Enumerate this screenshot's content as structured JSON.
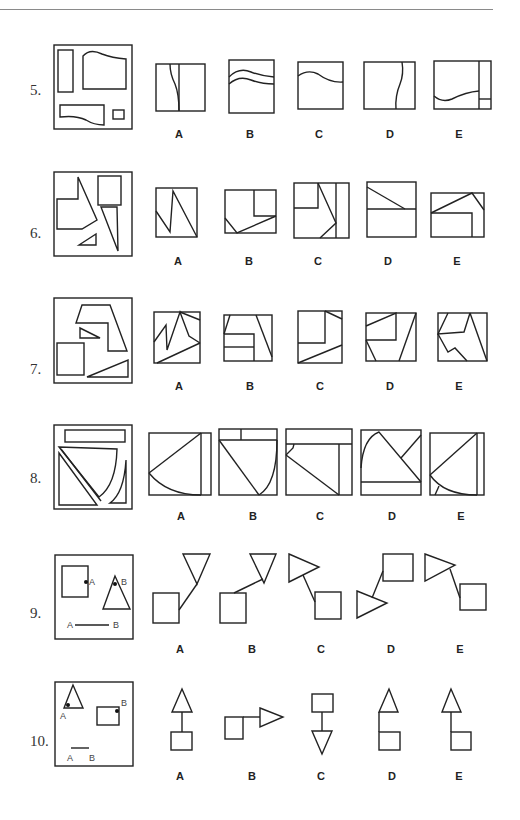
{
  "page": {
    "background": "#ffffff",
    "ink_color": "#222222"
  },
  "questions": [
    {
      "number": "5.",
      "prompt_figure": "square frame containing a tall rectangle, a wide shape with wavy top edge, a flat shape with wavy bottom edge, and a small square",
      "options": [
        {
          "label": "A",
          "description": "square split by a vertical line and a wavy vertical curve"
        },
        {
          "label": "B",
          "description": "square crossed by two parallel wavy horizontal curves"
        },
        {
          "label": "C",
          "description": "square crossed by one wavy horizontal curve near the top"
        },
        {
          "label": "D",
          "description": "square crossed by one wavy vertical curve right of center"
        },
        {
          "label": "E",
          "description": "rectangle with wavy curve, narrow right strip split by a short horizontal line"
        }
      ]
    },
    {
      "number": "6.",
      "prompt_figure": "square frame containing an irregular pentagon with spike, a square, a long thin triangle and a small triangle",
      "options": [
        {
          "label": "A",
          "description": "square with zigzag line"
        },
        {
          "label": "B",
          "description": "rectangle with small square in top right and angled line"
        },
        {
          "label": "C",
          "description": "square with inner square top-left, right strip and diagonals"
        },
        {
          "label": "D",
          "description": "rectangle split horizontally with a diagonal in the top half"
        },
        {
          "label": "E",
          "description": "rectangle with inner block and angled lines"
        }
      ]
    },
    {
      "number": "7.",
      "prompt_figure": "square frame containing a hook-shaped polygon, a small triangle, a square and a long flat triangle",
      "options": [
        {
          "label": "A",
          "description": "square with zigzag and diagonals"
        },
        {
          "label": "B",
          "description": "square with two stacked horizontal bars and slanted lines"
        },
        {
          "label": "C",
          "description": "square with inner square top-left and diagonals"
        },
        {
          "label": "D",
          "description": "square with inner square and slanted lines"
        },
        {
          "label": "E",
          "description": "square with irregular polyline and diagonals"
        }
      ]
    },
    {
      "number": "8.",
      "prompt_figure": "square frame containing a long bar, a curved-side triangle, a thin diagonal strip and a small curved sliver",
      "options": [
        {
          "label": "A",
          "description": "square with right strip, diagonal and bottom curve"
        },
        {
          "label": "B",
          "description": "square with top strip split, diagonal and curve"
        },
        {
          "label": "C",
          "description": "square with top strip, right strip and diagonal"
        },
        {
          "label": "D",
          "description": "square with arc, diagonal and bottom strip"
        },
        {
          "label": "E",
          "description": "square with right strip, diagonal and curve"
        }
      ]
    },
    {
      "number": "9.",
      "prompt_figure": "square frame with a square marked point A on its right edge, a triangle marked point B at its apex, and a line segment A—B",
      "prompt_labels": {
        "square_point": "A",
        "triangle_point": "B",
        "segment_start": "A",
        "segment_end": "B"
      },
      "options": [
        {
          "label": "A",
          "description": "square connected to inverted triangle apex"
        },
        {
          "label": "B",
          "description": "square top connected to inverted triangle apex"
        },
        {
          "label": "C",
          "description": "right-pointing triangle connected to square"
        },
        {
          "label": "D",
          "description": "square connected to right-pointing triangle"
        },
        {
          "label": "E",
          "description": "right-pointing triangle connected to square"
        }
      ]
    },
    {
      "number": "10.",
      "prompt_figure": "square frame with a triangle marked point A at its lower-left corner, a rectangle marked point B at its upper-right corner, and a short segment A—B",
      "prompt_labels": {
        "triangle_point": "A",
        "rectangle_point": "B",
        "segment_start": "A",
        "segment_end": "B"
      },
      "options": [
        {
          "label": "A",
          "description": "triangle above square joined by a vertical line"
        },
        {
          "label": "B",
          "description": "square joined to right-pointing triangle"
        },
        {
          "label": "C",
          "description": "square above inverted triangle joined by a vertical line"
        },
        {
          "label": "D",
          "description": "triangle sitting on square at left side"
        },
        {
          "label": "E",
          "description": "triangle joined to square by line on left"
        }
      ]
    }
  ]
}
